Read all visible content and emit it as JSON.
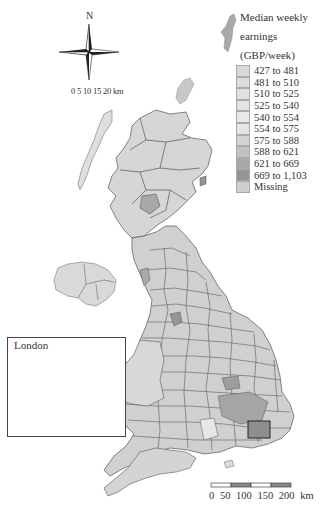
{
  "title": "Median weekly earnings (GBP/week)",
  "legend": {
    "title_line1": "Median weekly",
    "title_line2": "earnings",
    "title_line3": "(GBP/week)",
    "items": [
      {
        "label": "427 to 481",
        "color": "#d9d9d9"
      },
      {
        "label": "481 to 510",
        "color": "#dcdcdc"
      },
      {
        "label": "510 to 525",
        "color": "#e0e0e0"
      },
      {
        "label": "525 to 540",
        "color": "#e3e3e3"
      },
      {
        "label": "540 to 554",
        "color": "#e8e8e8"
      },
      {
        "label": "554 to 575",
        "color": "#e5e5e5"
      },
      {
        "label": "575 to 588",
        "color": "#d4d4d4"
      },
      {
        "label": "588 to 621",
        "color": "#c2c2c2"
      },
      {
        "label": "621 to 669",
        "color": "#a9a9a9"
      },
      {
        "label": "669 to 1,103",
        "color": "#959595"
      },
      {
        "label": "Missing",
        "color": "#cfcfcf"
      }
    ]
  },
  "compass": {
    "north_label": "N"
  },
  "inset": {
    "title": "London",
    "scale_labels": "0  5 10 15 20 km"
  },
  "scale_bar": {
    "labels": "0   50  100 150 200 km"
  },
  "colors": {
    "border": "#555555",
    "land_light": "#dedede",
    "land_mid": "#c8c8c8",
    "land_dark": "#9a9a9a",
    "background": "#ffffff"
  }
}
